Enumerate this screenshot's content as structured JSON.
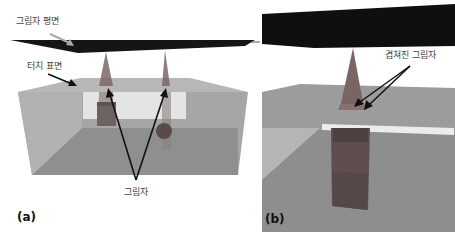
{
  "figure": {
    "panel_a": {
      "tag": "(a)",
      "labels": {
        "shadow_plane": "그림자 평면",
        "touch_surface": "터치 표면",
        "shadow": "그림자"
      }
    },
    "panel_b": {
      "tag": "(b)",
      "labels": {
        "overlapped_shadow": "겹쳐진 그림자"
      }
    },
    "colors": {
      "plane": "#111111",
      "surface": "#a9a9a9",
      "floor": "#8e8e8e",
      "highlight": "#e6e6e6",
      "shadow_cone": "#7a6a6a",
      "object": "#6a5a5a"
    }
  }
}
